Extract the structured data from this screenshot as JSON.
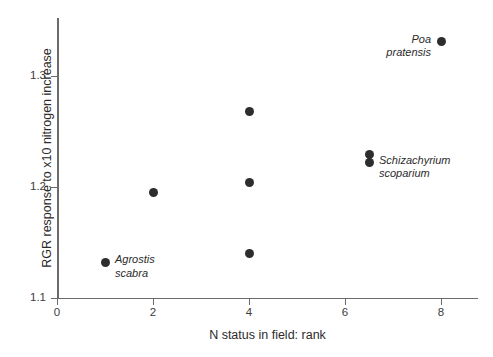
{
  "chart_data": {
    "type": "scatter",
    "title": "",
    "xlabel": "N status in field: rank",
    "ylabel": "RGR response to x10 nitrogen increase",
    "xlim": [
      0,
      8.8
    ],
    "ylim": [
      1.1,
      1.355
    ],
    "grid": false,
    "legend": "none",
    "xticks": [
      "0",
      "2",
      "4",
      "6",
      "8"
    ],
    "xtick_values": [
      0,
      2,
      4,
      6,
      8
    ],
    "yticks": [
      "1.1",
      "1.2",
      "1.3"
    ],
    "ytick_values": [
      1.1,
      1.2,
      1.3
    ],
    "points": [
      {
        "x": 1,
        "y": 1.132,
        "label": "Agrostis\nscabra",
        "label_side": "right"
      },
      {
        "x": 2,
        "y": 1.195,
        "label": "",
        "label_side": "right"
      },
      {
        "x": 4,
        "y": 1.268,
        "label": "",
        "label_side": "right"
      },
      {
        "x": 4,
        "y": 1.204,
        "label": "",
        "label_side": "right"
      },
      {
        "x": 4,
        "y": 1.14,
        "label": "",
        "label_side": "right"
      },
      {
        "x": 6.5,
        "y": 1.229,
        "label": "",
        "label_side": "right"
      },
      {
        "x": 6.5,
        "y": 1.222,
        "label": "Schizachyrium\nscoparium",
        "label_side": "right"
      },
      {
        "x": 8,
        "y": 1.331,
        "label": "Poa\npratensis",
        "label_side": "left"
      }
    ],
    "marker_color": "#2d2d2d",
    "axis_color": "#6b6b6b"
  }
}
